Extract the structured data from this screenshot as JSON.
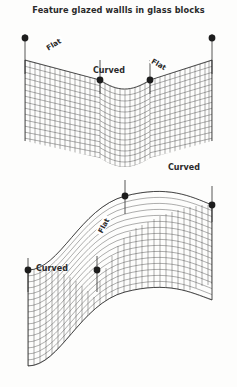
{
  "page": {
    "title": "Feature glazed wallls in glass blocks",
    "background_color": "#fdfdfc",
    "ink_color": "#2b2b2b"
  },
  "figures": [
    {
      "id": "upper-wall",
      "name": "v-shaped-glass-block-wall",
      "description": "Vee / chevron plan wall of glass blocks seen in perspective, flat panels at each end meeting a curved valley in the centre.",
      "segment_labels": [
        {
          "text": "Flat",
          "position": "upper-left-slope"
        },
        {
          "text": "Curved",
          "position": "centre-valley"
        },
        {
          "text": "Flat",
          "position": "upper-right-slope"
        }
      ],
      "markers": 4,
      "marker_label": "setting-out point"
    },
    {
      "id": "lower-wall",
      "name": "s-curve-glass-block-wall",
      "description": "Serpentine S-plan wall of glass blocks seen in perspective, curved bays at each end joined by a flat diagonal panel.",
      "segment_labels": [
        {
          "text": "Curved",
          "position": "upper-right-crest"
        },
        {
          "text": "Flat",
          "position": "centre-diagonal"
        },
        {
          "text": "Curved",
          "position": "lower-left-trough"
        }
      ],
      "markers": 4,
      "marker_label": "setting-out point"
    }
  ],
  "legend": {
    "flat_label": "Flat",
    "curved_label": "Curved"
  }
}
